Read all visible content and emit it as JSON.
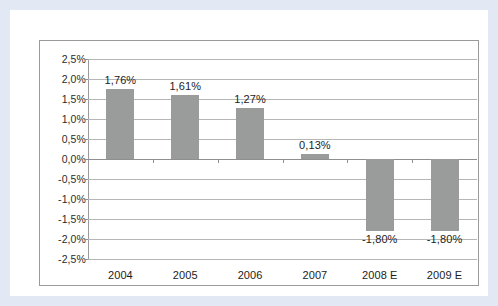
{
  "chart_data": {
    "type": "bar",
    "title": "",
    "subtitle": "",
    "xlabel": "",
    "ylabel": "",
    "categories": [
      "2004",
      "2005",
      "2006",
      "2007",
      "2008 E",
      "2009 E"
    ],
    "values": [
      1.76,
      1.61,
      1.27,
      0.13,
      -1.8,
      -1.8
    ],
    "data_labels": [
      "1,76%",
      "1,61%",
      "1,27%",
      "0,13%",
      "-1,80%",
      "-1,80%"
    ],
    "ylim": [
      -2.5,
      2.5
    ],
    "ytick_values": [
      2.5,
      2.0,
      1.5,
      1.0,
      0.5,
      0.0,
      -0.5,
      -1.0,
      -1.5,
      -2.0,
      -2.5
    ],
    "ytick_labels": [
      "2,5%",
      "2,0%",
      "1,5%",
      "1,0%",
      "0,5%",
      "0,0%",
      "-0,5%",
      "-1,0%",
      "-1,5%",
      "-2,0%",
      "-2,5%"
    ],
    "grid": true,
    "legend": false,
    "legend_position": "none",
    "series": [
      {
        "name": "",
        "values": [
          1.76,
          1.61,
          1.27,
          0.13,
          -1.8,
          -1.8
        ]
      }
    ]
  },
  "style": {
    "bar_color": "#9a9b9b",
    "gridline_color": "#b6b6b6",
    "axis_color": "#8f8f8f",
    "chart_border_color": "#9a9a9a",
    "plot_background": "#ffffff",
    "page_frame_color": "#e2e9f4",
    "text_color": "#1c1c1c"
  }
}
